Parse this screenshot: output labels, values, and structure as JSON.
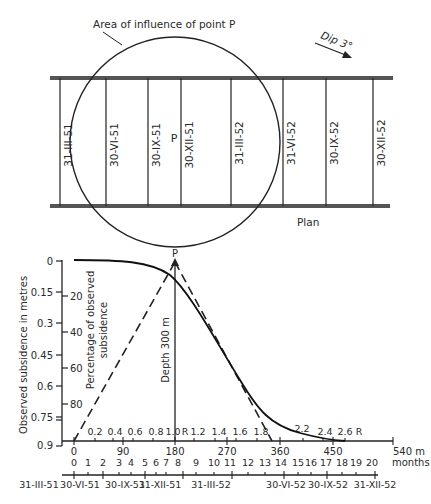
{
  "plan": {
    "influence_label": "Area of influence of point P",
    "dip_label": "Dip 3°",
    "point_label": "P",
    "caption": "Plan",
    "face_positions": [
      {
        "label": "31-III-51",
        "x": 60
      },
      {
        "label": "30-VI-51",
        "x": 106
      },
      {
        "label": "30-IX-51",
        "x": 148
      },
      {
        "label": "30-XII-51",
        "x": 181
      },
      {
        "label": "31-III-52",
        "x": 231
      },
      {
        "label": "31-VI-52",
        "x": 283
      },
      {
        "label": "30-IX-52",
        "x": 326
      },
      {
        "label": "30-XII-52",
        "x": 373
      }
    ]
  },
  "profile": {
    "point_label": "P",
    "depth_label": "Depth 300 m",
    "y_axis_left_label": "Observed subsidence in metres",
    "y_axis_left_ticks": [
      "0",
      "0.15",
      "0.3",
      "0.45",
      "0.6",
      "0.75",
      "0.9"
    ],
    "y_axis_right_label_1": "Percentage of observed",
    "y_axis_right_label_2": "subsidence",
    "y_axis_right_ticks": [
      "20",
      "40",
      "60",
      "80"
    ],
    "r_ratio_ticks": [
      "0.2",
      "0.4",
      "0.6",
      "0.8",
      "1.0",
      "R",
      "1.2",
      "1.4",
      "1.6",
      "1.8",
      "2.2",
      "2.4",
      "2.6",
      "R"
    ],
    "distance_ticks": [
      "0",
      "90",
      "180",
      "270",
      "360",
      "450"
    ],
    "distance_end_label": "540 m",
    "months_ticks": [
      "0",
      "1",
      "2",
      "3",
      "4",
      "5",
      "6",
      "7",
      "8",
      "9",
      "10",
      "11",
      "12",
      "13",
      "14",
      "15",
      "16",
      "17",
      "18",
      "19",
      "20"
    ],
    "months_label": "months",
    "date_ticks": [
      "31-III-51",
      "30-VI-51",
      "30-IX-51",
      "31-XII-51",
      "31-III-52",
      "30-VI-52",
      "30-IX-52",
      "31-XII-52"
    ]
  }
}
